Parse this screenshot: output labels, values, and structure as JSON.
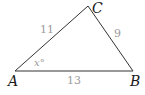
{
  "diagram": {
    "type": "triangle",
    "vertices": [
      {
        "label": "A",
        "x": 15,
        "y": 71
      },
      {
        "label": "B",
        "x": 133,
        "y": 71
      },
      {
        "label": "C",
        "x": 88,
        "y": 6
      }
    ],
    "sides": [
      {
        "between": "AC",
        "label": "11"
      },
      {
        "between": "CB",
        "label": "9"
      },
      {
        "between": "AB",
        "label": "13"
      }
    ],
    "angle": {
      "at": "A",
      "label": "x°"
    },
    "colors": {
      "line": "#333333",
      "vertex_label": "#1a1a1a",
      "measure_label": "#9a9a9a"
    }
  }
}
